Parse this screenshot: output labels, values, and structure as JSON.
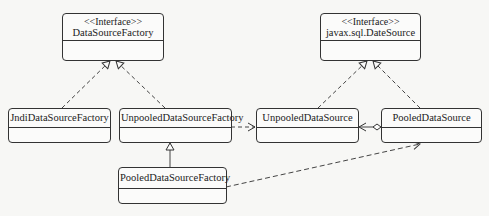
{
  "diagram": {
    "type": "uml-class-diagram",
    "classes": [
      {
        "id": "DataSourceFactory",
        "stereotype": "<<Interface>>",
        "name": "DataSourceFactory"
      },
      {
        "id": "DateSource",
        "stereotype": "<<Interface>>",
        "name": "javax.sql.DateSource"
      },
      {
        "id": "JndiDataSourceFactory",
        "name": "JndiDataSourceFactory"
      },
      {
        "id": "UnpooledDataSourceFactory",
        "name": "UnpooledDataSourceFactory"
      },
      {
        "id": "UnpooledDataSource",
        "name": "UnpooledDataSource"
      },
      {
        "id": "PooledDataSource",
        "name": "PooledDataSource"
      },
      {
        "id": "PooledDataSourceFactory",
        "name": "PooledDataSourceFactory"
      }
    ],
    "relations": [
      {
        "from": "JndiDataSourceFactory",
        "to": "DataSourceFactory",
        "kind": "realization"
      },
      {
        "from": "UnpooledDataSourceFactory",
        "to": "DataSourceFactory",
        "kind": "realization"
      },
      {
        "from": "UnpooledDataSource",
        "to": "DateSource",
        "kind": "realization"
      },
      {
        "from": "PooledDataSource",
        "to": "DateSource",
        "kind": "realization"
      },
      {
        "from": "PooledDataSourceFactory",
        "to": "UnpooledDataSourceFactory",
        "kind": "generalization"
      },
      {
        "from": "UnpooledDataSourceFactory",
        "to": "UnpooledDataSource",
        "kind": "dependency"
      },
      {
        "from": "PooledDataSourceFactory",
        "to": "PooledDataSource",
        "kind": "dependency"
      },
      {
        "from": "PooledDataSource",
        "to": "UnpooledDataSource",
        "kind": "aggregation"
      }
    ]
  }
}
